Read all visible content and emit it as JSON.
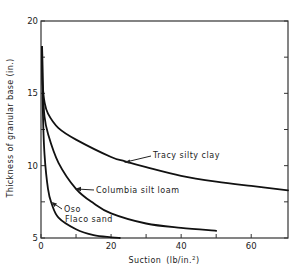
{
  "chart_data": {
    "type": "line",
    "title": "",
    "xlabel": "Suction (lb/in.2)",
    "ylabel": "Thickness of granular base (in.)",
    "xlim": [
      0,
      70.5
    ],
    "ylim": [
      5,
      20
    ],
    "x_ticks": [
      0,
      20,
      40,
      60
    ],
    "x_tick_labels": [
      "0",
      "20",
      "40",
      "60"
    ],
    "x_minor_ticks": [
      10,
      30,
      50
    ],
    "y_ticks": [
      5,
      10,
      15,
      20
    ],
    "y_tick_labels": [
      "5",
      "10",
      "15",
      "20"
    ],
    "y_minor_ticks": [
      7.5,
      12.5,
      17.5
    ],
    "grid": false,
    "legend": "inline annotations",
    "series": [
      {
        "name": "Tracy silty clay",
        "x": [
          0.3,
          0.5,
          1,
          2,
          5,
          10,
          20,
          24,
          30,
          40,
          50,
          60,
          70.5
        ],
        "y": [
          18.2,
          15.6,
          14.4,
          13.6,
          12.6,
          11.8,
          10.6,
          10.3,
          9.9,
          9.3,
          8.9,
          8.6,
          8.3
        ]
      },
      {
        "name": "Columbia silt loam",
        "x": [
          0.3,
          0.5,
          1,
          2,
          5,
          10,
          15,
          20,
          30,
          40,
          50
        ],
        "y": [
          18.2,
          15.4,
          13.4,
          12.2,
          10.2,
          8.4,
          7.4,
          6.7,
          6.0,
          5.7,
          5.5
        ]
      },
      {
        "name": "Oso Flaco sand",
        "x": [
          0.3,
          0.5,
          1,
          2,
          3,
          5,
          10,
          15,
          20,
          22.5
        ],
        "y": [
          18.2,
          14.0,
          10.8,
          8.4,
          7.4,
          6.4,
          5.6,
          5.2,
          5.05,
          5.0
        ]
      }
    ],
    "annotations": [
      {
        "text": "Tracy silty clay",
        "arrow_to": [
          24,
          10.3
        ]
      },
      {
        "text": "Columbia silt loam",
        "arrow_to": [
          10,
          8.4
        ]
      },
      {
        "text": "Oso",
        "text2": "Flaco sand",
        "arrow_to": [
          3,
          7.4
        ]
      }
    ]
  },
  "labels": {
    "ylabel": "Thickness of granular base (in.)",
    "xlabel_main": "Suction",
    "xlabel_unit": "(lb/in.",
    "xlabel_sup": "2",
    "xlabel_close": ")",
    "tracy": "Tracy silty clay",
    "columbia": "Columbia silt loam",
    "oso_line1": "Oso",
    "oso_line2": "Flaco sand"
  }
}
